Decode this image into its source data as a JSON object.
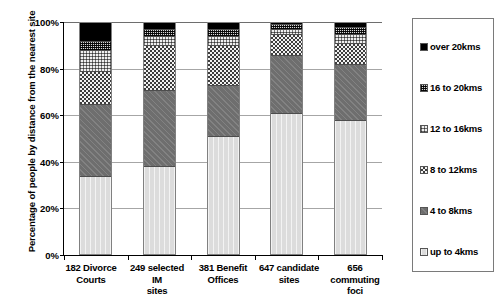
{
  "chart": {
    "type": "bar",
    "y_axis_title": "Percentage of people by distance from the nearest site"
  },
  "y_ticks": [
    {
      "label": "100%",
      "value": 100
    },
    {
      "label": "80%",
      "value": 80
    },
    {
      "label": "60%",
      "value": 60
    },
    {
      "label": "40%",
      "value": 40
    },
    {
      "label": "20%",
      "value": 20
    },
    {
      "label": "0%",
      "value": 0
    }
  ],
  "x_labels": [
    {
      "line1": "182 Divorce",
      "line2": "Courts"
    },
    {
      "line1": "249 selected IM",
      "line2": "sites"
    },
    {
      "line1": "381 Benefit",
      "line2": "Offices"
    },
    {
      "line1": "647 candidate",
      "line2": "sites"
    },
    {
      "line1": "656 commuting",
      "line2": "foci"
    }
  ],
  "legend": {
    "items": [
      {
        "label": "over 20kms",
        "key": "over_20kms",
        "color": "#000000"
      },
      {
        "label": "16 to 20kms",
        "key": "16_to_20kms",
        "color": "#b4b4b4"
      },
      {
        "label": "12 to 16kms",
        "key": "12_to_16kms",
        "color": "#e0e0e0"
      },
      {
        "label": "8 to 12kms",
        "key": "8_to_12kms",
        "color": "#8a8a8a"
      },
      {
        "label": "4 to 8kms",
        "key": "4_to_8kms",
        "color": "#6e6e6e"
      },
      {
        "label": "up to 4kms",
        "key": "up_to_4kms",
        "color": "#dcdcdc"
      }
    ]
  },
  "chart_data": {
    "type": "bar",
    "stacked": true,
    "title": "",
    "xlabel": "",
    "ylabel": "Percentage of people by distance from the nearest site",
    "ylim": [
      0,
      100
    ],
    "ytick_labels": [
      "0%",
      "20%",
      "40%",
      "60%",
      "80%",
      "100%"
    ],
    "grid": true,
    "legend_position": "right",
    "categories": [
      "182 Divorce Courts",
      "249 selected IM sites",
      "381 Benefit Offices",
      "647 candidate sites",
      "656 commuting foci"
    ],
    "series": [
      {
        "name": "up to 4kms",
        "values": [
          34,
          38,
          51,
          61,
          59
        ]
      },
      {
        "name": "4 to 8kms",
        "values": [
          31,
          33,
          22,
          25,
          24
        ]
      },
      {
        "name": "8 to 12kms",
        "values": [
          14,
          19,
          17,
          9,
          9
        ]
      },
      {
        "name": "12 to 16kms",
        "values": [
          9,
          4,
          4,
          2,
          4
        ]
      },
      {
        "name": "16 to 20kms",
        "values": [
          4,
          3,
          3,
          2,
          3
        ]
      },
      {
        "name": "over 20kms",
        "values": [
          8,
          3,
          3,
          1,
          2
        ]
      }
    ]
  }
}
